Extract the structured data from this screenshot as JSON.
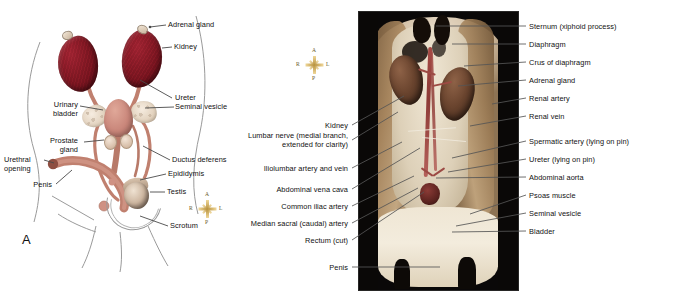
{
  "figure": {
    "panel_a_letter": "A",
    "panel_a": {
      "title": "Male urogenital system, ventral view (diagram)",
      "labels": [
        {
          "id": "adrenal-gland",
          "text": "Adrenal gland",
          "side": "right"
        },
        {
          "id": "kidney",
          "text": "Kidney",
          "side": "right"
        },
        {
          "id": "ureter",
          "text": "Ureter",
          "side": "right"
        },
        {
          "id": "seminal-vesicle",
          "text": "Seminal vesicle",
          "side": "right"
        },
        {
          "id": "ductus-deferens",
          "text": "Ductus deferens",
          "side": "right"
        },
        {
          "id": "epididymis",
          "text": "Epididymis",
          "side": "right"
        },
        {
          "id": "testis",
          "text": "Testis",
          "side": "right"
        },
        {
          "id": "scrotum",
          "text": "Scrotum",
          "side": "right"
        },
        {
          "id": "urinary-bladder",
          "text": "Urinary\nbladder",
          "line1": "Urinary",
          "line2": "bladder",
          "side": "left"
        },
        {
          "id": "prostate-gland",
          "text": "Prostate\ngland",
          "line1": "Prostate",
          "line2": "gland",
          "side": "left"
        },
        {
          "id": "urethral-opening",
          "text": "Urethral\nopening",
          "line1": "Urethral",
          "line2": "opening",
          "side": "left"
        },
        {
          "id": "penis",
          "text": "Penis",
          "side": "left"
        }
      ]
    },
    "panel_b": {
      "title": "Dissected male specimen photograph, ventral view",
      "labels_left": [
        {
          "id": "kidney",
          "line1": "Kidney"
        },
        {
          "id": "lumbar-nerve",
          "line1": "Lumbar nerve (medial branch,",
          "line2": "extended for clarity)"
        },
        {
          "id": "iliolumbar-artery-and-vein",
          "line1": "Iliolumbar artery and vein"
        },
        {
          "id": "abdominal-vena-cava",
          "line1": "Abdominal vena cava"
        },
        {
          "id": "common-iliac-artery",
          "line1": "Common iliac artery"
        },
        {
          "id": "median-sacral-artery",
          "line1": "Median sacral (caudal) artery"
        },
        {
          "id": "rectum-cut",
          "line1": "Rectum (cut)"
        },
        {
          "id": "penis",
          "line1": "Penis"
        }
      ],
      "labels_right": [
        {
          "id": "sternum-xiphoid-process",
          "line1": "Sternum (xiphoid process)"
        },
        {
          "id": "diaphragm",
          "line1": "Diaphragm"
        },
        {
          "id": "crus-of-diaphragm",
          "line1": "Crus of diaphragm"
        },
        {
          "id": "adrenal-gland",
          "line1": "Adrenal gland"
        },
        {
          "id": "renal-artery",
          "line1": "Renal artery"
        },
        {
          "id": "renal-vein",
          "line1": "Renal vein"
        },
        {
          "id": "spermatic-artery",
          "line1": "Spermatic artery (lying on pin)"
        },
        {
          "id": "ureter",
          "line1": "Ureter (lying on pin)"
        },
        {
          "id": "abdominal-aorta",
          "line1": "Abdominal aorta"
        },
        {
          "id": "psoas-muscle",
          "line1": "Psoas muscle"
        },
        {
          "id": "seminal-vesicle",
          "line1": "Seminal vesicle"
        },
        {
          "id": "bladder",
          "line1": "Bladder"
        }
      ]
    },
    "compass": {
      "anterior": "A",
      "posterior": "P",
      "right": "R",
      "left": "L"
    },
    "colors": {
      "kidney_diagram": "#7d1722",
      "bladder_diagram": "#c9867a",
      "seminal_vesicle_diagram": "#e2d2be",
      "tube_salmon": "#c0806f",
      "compass_gold": "#b8923f",
      "leader_line": "#4a4a4a",
      "photo_background": "#0a0808",
      "text": "#111111"
    }
  }
}
